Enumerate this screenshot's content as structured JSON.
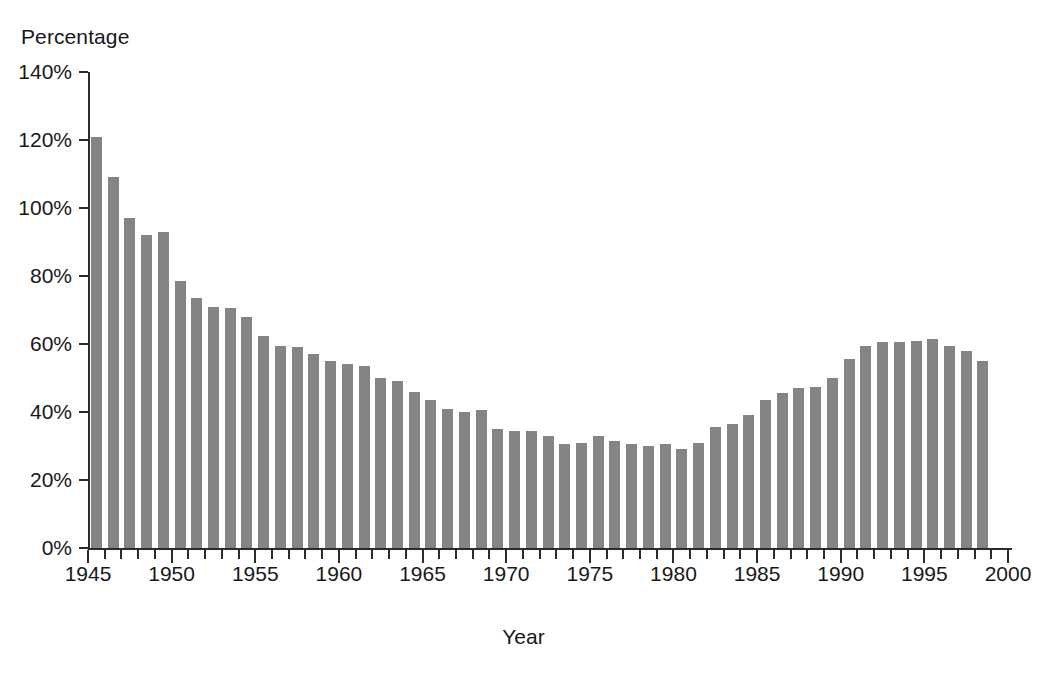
{
  "chart_data": {
    "type": "bar",
    "title": "",
    "ylabel": "Percentage",
    "xlabel": "Year",
    "ylim": [
      0,
      140
    ],
    "grid": false,
    "legend": null,
    "bar_color": "#848484",
    "axis_color": "#2b2b2b",
    "y_tick_labels": [
      "140%",
      "120%",
      "100%",
      "80%",
      "60%",
      "40%",
      "20%",
      "0%"
    ],
    "y_tick_values": [
      140,
      120,
      100,
      80,
      60,
      40,
      20,
      0
    ],
    "x_tick_labels": [
      "1945",
      "1950",
      "1955",
      "1960",
      "1965",
      "1970",
      "1975",
      "1980",
      "1985",
      "1990",
      "1995",
      "2000"
    ],
    "x_tick_values": [
      1945,
      1950,
      1955,
      1960,
      1965,
      1970,
      1975,
      1980,
      1985,
      1990,
      1995,
      2000
    ],
    "x_minor_ticks": true,
    "categories": [
      1946,
      1947,
      1948,
      1949,
      1950,
      1951,
      1952,
      1953,
      1954,
      1955,
      1956,
      1957,
      1958,
      1959,
      1960,
      1961,
      1962,
      1963,
      1964,
      1965,
      1966,
      1967,
      1968,
      1969,
      1970,
      1971,
      1972,
      1973,
      1974,
      1975,
      1976,
      1977,
      1978,
      1979,
      1980,
      1981,
      1982,
      1983,
      1984,
      1985,
      1986,
      1987,
      1988,
      1989,
      1990,
      1991,
      1992,
      1993,
      1994,
      1995,
      1996,
      1997,
      1998,
      1999
    ],
    "values": [
      121,
      109,
      97,
      92,
      93,
      78.5,
      73.5,
      71,
      70.5,
      68,
      62.5,
      59.5,
      59,
      57,
      55,
      54,
      53.5,
      50,
      49,
      46,
      43.5,
      41,
      40,
      40.5,
      35,
      34.5,
      34.5,
      33,
      30.5,
      31,
      33,
      31.5,
      30.5,
      30,
      30.5,
      29,
      31,
      35.5,
      36.5,
      39,
      43.5,
      45.5,
      47,
      47.5,
      50,
      55.5,
      59.5,
      60.5,
      60.5,
      61,
      61.5,
      59.5,
      58,
      55
    ]
  }
}
